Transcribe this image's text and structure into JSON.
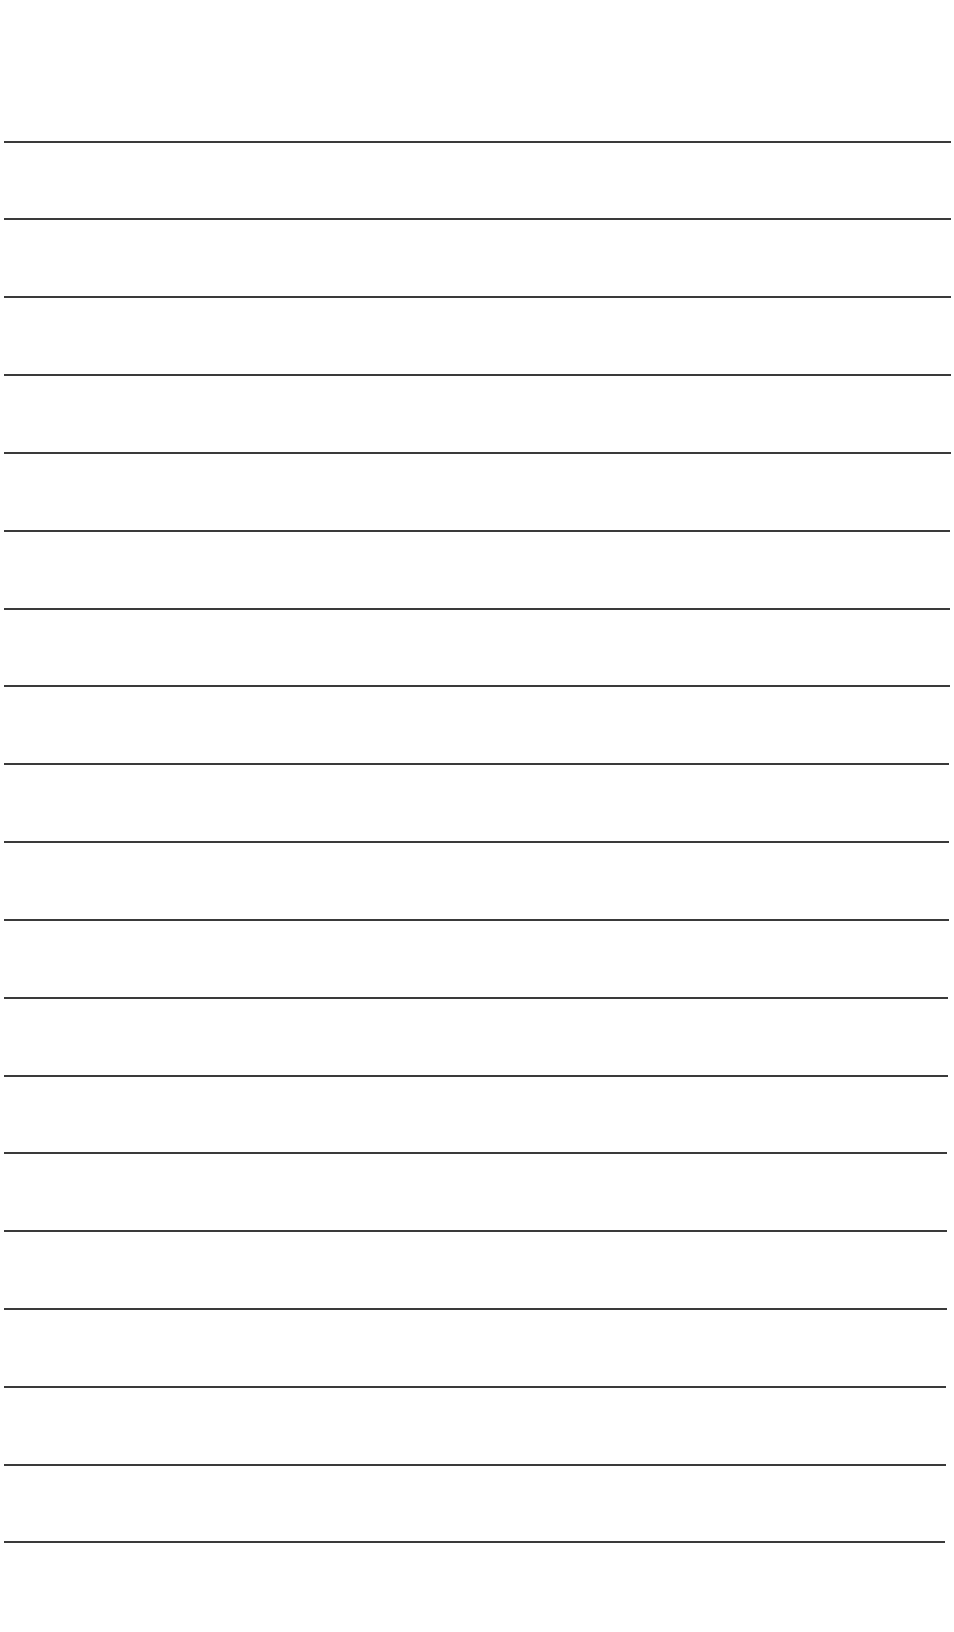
{
  "document": {
    "type": "lined-paper",
    "background_color": "#ffffff",
    "line_color": "#3a3a3a",
    "line_thickness_px": 2,
    "line_count": 19,
    "lines": [
      {
        "y": 142,
        "x_start": 4,
        "x_end": 951
      },
      {
        "y": 219,
        "x_start": 4,
        "x_end": 951
      },
      {
        "y": 297,
        "x_start": 4,
        "x_end": 951
      },
      {
        "y": 375,
        "x_start": 4,
        "x_end": 951
      },
      {
        "y": 453,
        "x_start": 4,
        "x_end": 951
      },
      {
        "y": 531,
        "x_start": 4,
        "x_end": 950
      },
      {
        "y": 609,
        "x_start": 4,
        "x_end": 950
      },
      {
        "y": 686,
        "x_start": 4,
        "x_end": 950
      },
      {
        "y": 764,
        "x_start": 4,
        "x_end": 949
      },
      {
        "y": 842,
        "x_start": 4,
        "x_end": 949
      },
      {
        "y": 920,
        "x_start": 4,
        "x_end": 949
      },
      {
        "y": 998,
        "x_start": 4,
        "x_end": 948
      },
      {
        "y": 1076,
        "x_start": 4,
        "x_end": 948
      },
      {
        "y": 1153,
        "x_start": 4,
        "x_end": 947
      },
      {
        "y": 1231,
        "x_start": 4,
        "x_end": 947
      },
      {
        "y": 1309,
        "x_start": 4,
        "x_end": 947
      },
      {
        "y": 1387,
        "x_start": 4,
        "x_end": 946
      },
      {
        "y": 1465,
        "x_start": 4,
        "x_end": 946
      },
      {
        "y": 1542,
        "x_start": 4,
        "x_end": 945
      }
    ]
  }
}
